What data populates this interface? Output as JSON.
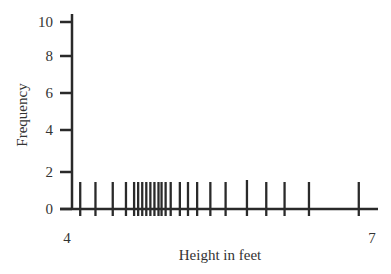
{
  "chart_data": {
    "type": "rug",
    "title": "",
    "xlabel": "Height in feet",
    "ylabel": "Frequency",
    "xlim": [
      4,
      7
    ],
    "ylim": [
      0,
      10
    ],
    "x_ticks": [
      {
        "label": "4",
        "value": 4
      },
      {
        "label": "7",
        "value": 7
      }
    ],
    "y_ticks": [
      {
        "label": "10",
        "value": 10
      },
      {
        "label": "8",
        "value": 8
      },
      {
        "label": "6",
        "value": 6
      },
      {
        "label": "4",
        "value": 4
      },
      {
        "label": "2",
        "value": 2
      },
      {
        "label": "0",
        "value": 0
      }
    ],
    "grid": false,
    "legend": null,
    "values": [
      4.13,
      4.28,
      4.45,
      4.58,
      4.66,
      4.7,
      4.74,
      4.78,
      4.82,
      4.86,
      4.9,
      4.93,
      4.97,
      5.02,
      5.11,
      5.19,
      5.28,
      5.41,
      5.56,
      5.77,
      5.96,
      6.14,
      6.38,
      6.87
    ],
    "rug_height_frequency": 1.5
  },
  "colors": {
    "axis": "#2a2a2a",
    "rug": "#2a2a2a",
    "text": "#333333"
  }
}
